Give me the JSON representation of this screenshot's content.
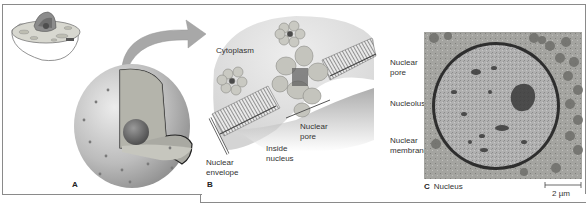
{
  "figure": {
    "panels": [
      {
        "id": "A",
        "letter": "A",
        "description": "3D cutaway drawing of a cell nucleus with inset of whole cell"
      },
      {
        "id": "B",
        "letter": "B",
        "labels": {
          "cytoplasm": "Cytoplasm",
          "nuclear_pore_line1": "Nuclear",
          "nuclear_pore_line2": "pore",
          "inside_line1": "Inside",
          "inside_line2": "nucleus",
          "envelope_line1": "Nuclear",
          "envelope_line2": "envelope"
        }
      },
      {
        "id": "C",
        "letter": "C",
        "title": "Nucleus",
        "labels": {
          "pore_line1": "Nuclear",
          "pore_line2": "pore",
          "nucleolus": "Nucleolus",
          "membrane_line1": "Nuclear",
          "membrane_line2": "membrane"
        },
        "scale_bar": "2 µm"
      }
    ],
    "colors": {
      "frame": "#8a8a8a",
      "arrow": "#a8a8a8",
      "nucleus_shell": "#b5b5b5",
      "em_background": "#9c9c9c",
      "em_nucleus": "#b3b3b3",
      "em_dark": "#3c3c3c"
    }
  }
}
